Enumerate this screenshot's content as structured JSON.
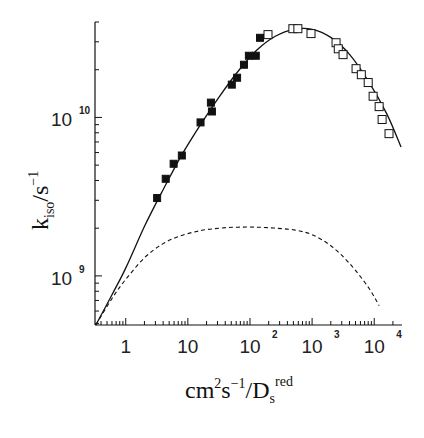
{
  "chart_data": {
    "type": "scatter",
    "title": "",
    "xscale": "log",
    "yscale": "log",
    "xlabel": {
      "base": "cm",
      "sup1": "2",
      "mid": "s",
      "sup2": "−1",
      "slash": "/D",
      "sub": "s",
      "sup3": "red"
    },
    "ylabel": {
      "base": "k",
      "sub": "iso",
      "slash": "/s",
      "sup": "−1"
    },
    "xlim": [
      0.32,
      28000
    ],
    "ylim": [
      490000000.0,
      40000000000.0
    ],
    "x_ticks": [
      {
        "value": 1,
        "base": "1",
        "exp": ""
      },
      {
        "value": 10,
        "base": "10",
        "exp": ""
      },
      {
        "value": 100,
        "base": "10",
        "exp": "2"
      },
      {
        "value": 1000,
        "base": "10",
        "exp": "3"
      },
      {
        "value": 10000,
        "base": "10",
        "exp": "4"
      }
    ],
    "y_ticks": [
      {
        "value": 1000000000.0,
        "base": "10",
        "exp": "9"
      },
      {
        "value": 10000000000.0,
        "base": "10",
        "exp": "10"
      }
    ],
    "series": [
      {
        "name": "filled squares",
        "marker": "filled-square",
        "x": [
          3.2,
          4.4,
          5.9,
          8.0,
          16,
          23.5,
          24.4,
          51,
          62,
          80,
          96,
          124,
          145
        ],
        "y": [
          3100000000.0,
          4100000000.0,
          5100000000.0,
          5750000000.0,
          9300000000.0,
          12400000000.0,
          10900000000.0,
          16100000000.0,
          17800000000.0,
          21500000000.0,
          24500000000.0,
          24500000000.0,
          31800000000.0
        ]
      },
      {
        "name": "open squares",
        "marker": "open-square",
        "x": [
          195,
          490,
          590,
          960,
          2430,
          2640,
          3150,
          5100,
          6200,
          8000,
          9600,
          12000,
          13400,
          17300
        ],
        "y": [
          33300000000.0,
          36300000000.0,
          36300000000.0,
          33800000000.0,
          29600000000.0,
          27100000000.0,
          24900000000.0,
          20300000000.0,
          18600000000.0,
          16600000000.0,
          13600000000.0,
          11700000000.0,
          9700000000.0,
          7900000000.0
        ]
      },
      {
        "name": "fit (solid)",
        "style": "solid-line",
        "x": [
          0.33,
          0.6,
          1,
          2,
          4,
          8,
          16,
          32,
          64,
          128,
          256,
          512,
          1000,
          2000,
          4000,
          8000,
          16000,
          27000
        ],
        "y": [
          490000000.0,
          760000000.0,
          1120000000.0,
          2050000000.0,
          3500000000.0,
          5800000000.0,
          9000000000.0,
          13500000000.0,
          19500000000.0,
          26500000000.0,
          32500000000.0,
          36000000000.0,
          36000000000.0,
          32000000000.0,
          25000000000.0,
          17000000000.0,
          10500000000.0,
          6500000000.0
        ]
      },
      {
        "name": "component (dashed)",
        "style": "dashed-line",
        "x": [
          0.33,
          0.6,
          1,
          2,
          4,
          8,
          16,
          32,
          64,
          128,
          256,
          512,
          1000,
          2000,
          4000,
          8000,
          12000
        ],
        "y": [
          490000000.0,
          720000000.0,
          950000000.0,
          1300000000.0,
          1600000000.0,
          1800000000.0,
          1930000000.0,
          2000000000.0,
          2030000000.0,
          2030000000.0,
          2000000000.0,
          1950000000.0,
          1820000000.0,
          1550000000.0,
          1200000000.0,
          850000000.0,
          650000000.0
        ]
      }
    ],
    "grid": false,
    "legend": "none"
  }
}
